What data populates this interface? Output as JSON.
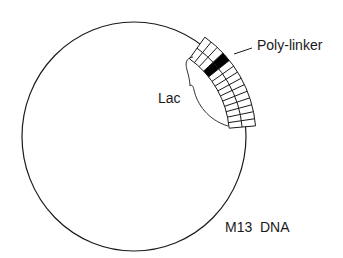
{
  "diagram": {
    "labels": {
      "polylinker": "Poly-linker",
      "lac": "Lac",
      "genome": "M13  DNA"
    },
    "colors": {
      "stroke": "#1a1a1a",
      "polylinker_fill": "#000000",
      "background": "#ffffff"
    },
    "circle": {
      "cx": 134,
      "cy": 136.5,
      "rx": 112,
      "ry": 114.5
    },
    "lac_region": {
      "r_inner": 95.5,
      "r_mid": 108.5,
      "r_outer": 122,
      "start_angle_deg": 5,
      "end_angle_deg": 54.5,
      "segments_below_polylinker": 10,
      "segments_above_polylinker": 3,
      "polylinker_start_deg": 38.6,
      "polylinker_end_deg": 43.2
    },
    "leader_line": {
      "x1": 234,
      "y1": 54,
      "x2": 252,
      "y2": 48
    }
  }
}
